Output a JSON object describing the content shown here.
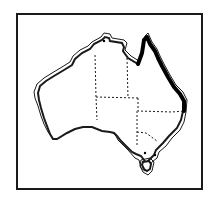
{
  "map": {
    "subject": "Australia",
    "highlighted_region": "Queensland east coast",
    "highlight_color": "#000000",
    "outline_color": "#1a1a1a",
    "background_color": "#ffffff",
    "state_borders_style": "dashed",
    "labels": []
  }
}
